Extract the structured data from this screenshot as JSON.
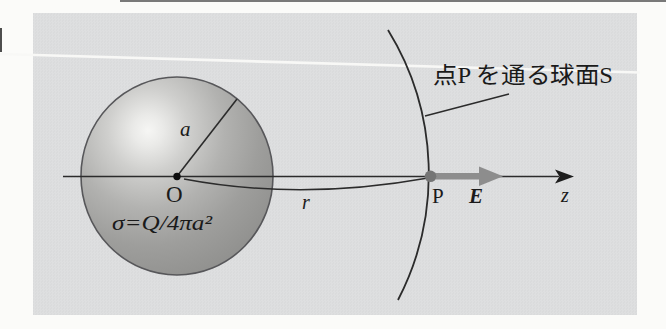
{
  "figure": {
    "surface_caption": "点P を通る球面S",
    "labels": {
      "radius": "a",
      "center": "O",
      "charge_density": "σ=Q/4πa²",
      "distance": "r",
      "point": "P",
      "field": "E",
      "axis": "z"
    },
    "colors": {
      "page_background": "#fbfbf9",
      "panel_background": "#dcddde",
      "line": "#2b2b2b",
      "field_arrow_gray": "#8d8d8d",
      "point_dot_gray": "#757575",
      "sphere_mid_gray": "#a8a8a6",
      "sphere_edge_gray": "#8e8e8c",
      "sphere_highlight": "#f6f6f4"
    }
  }
}
